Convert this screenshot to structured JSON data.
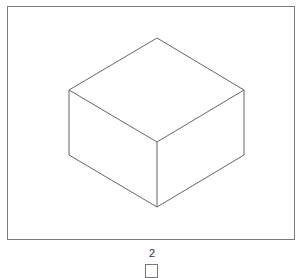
{
  "figure": {
    "frame_color": "#7a7a7a",
    "line_color": "#666666",
    "cube": {
      "top": [
        157,
        38
      ],
      "upper_left": [
        69,
        90
      ],
      "upper_right": [
        244,
        90
      ],
      "center": [
        157,
        142
      ],
      "lower_left": [
        69,
        155
      ],
      "lower_right": [
        244,
        155
      ],
      "bottom": [
        157,
        207
      ]
    }
  },
  "option": {
    "label": "2"
  }
}
